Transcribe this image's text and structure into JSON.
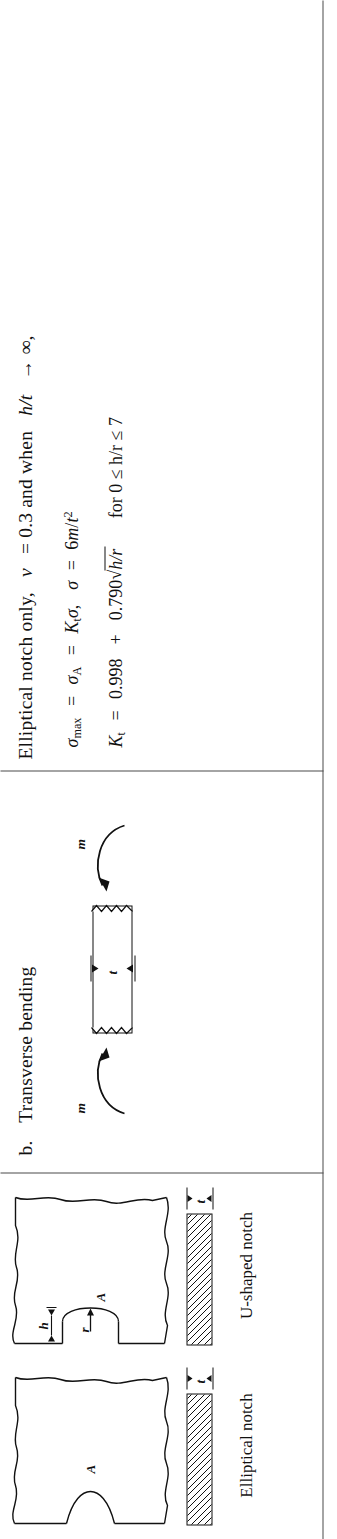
{
  "document": {
    "orientation": "rotated-90-ccw",
    "background": "#ffffff",
    "ink": "#111111"
  },
  "panels": {
    "formula": {
      "heading": "Elliptical notch only, ν = 0.3 and when h/t → ∞,",
      "heading_parts": {
        "lead": "Elliptical notch only,",
        "nu": "ν",
        "eq": "= 0.3 and when",
        "ratio": "h/t",
        "arrow": "→ ∞,"
      },
      "equation_1": {
        "full": "σmax = σA = Ktσ, σ = 6m/t²",
        "sigma": "σ",
        "sub_max": "max",
        "sub_A": "A",
        "K": "K",
        "sub_t": "t",
        "rhs_coeff": "6",
        "rhs_var": "m",
        "rhs_den": "t",
        "rhs_exp": "2"
      },
      "equation_2": {
        "full": "Kt = 0.998 + 0.790√(h/r)   for 0 ≤ h/r ≤ 7",
        "K": "K",
        "sub_t": "t",
        "const_a": "0.998",
        "plus": "+",
        "const_b": "0.790",
        "radicand": "h/r",
        "condition": "for 0 ≤ h/r ≤ 7"
      }
    },
    "bending": {
      "heading": "b.  Transverse bending",
      "heading_index": "b.",
      "heading_text": "Transverse bending",
      "moment_label_top": "m",
      "moment_label_bottom": "m",
      "thickness_label": "t"
    },
    "notches": {
      "elliptical": {
        "caption": "Elliptical notch",
        "point_label": "A",
        "thickness_label": "t"
      },
      "ushaped": {
        "caption": "U-shaped notch",
        "point_label": "A",
        "radius_label": "r",
        "width_label": "h",
        "thickness_label": "t"
      }
    }
  }
}
